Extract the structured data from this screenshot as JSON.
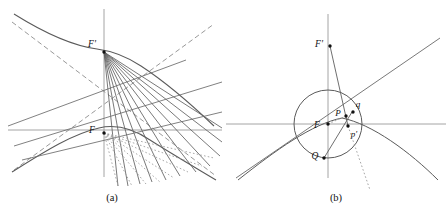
{
  "figure": {
    "panels": [
      {
        "id": "a",
        "caption": "(a)",
        "description": "Hyperbola with two foci and pencils of rays",
        "labels": [
          {
            "name": "focus-F-prime",
            "text": "F'",
            "x": 92,
            "y": 47
          },
          {
            "name": "focus-F",
            "text": "F",
            "x": 92,
            "y": 133
          }
        ]
      },
      {
        "id": "b",
        "caption": "(b)",
        "description": "Circle, parabola and directrix construction with points P, Q, p, q",
        "labels": [
          {
            "name": "focus-F-prime",
            "text": "F'",
            "x": 86,
            "y": 46
          },
          {
            "name": "point-P",
            "text": "P",
            "x": 104,
            "y": 115
          },
          {
            "name": "point-q",
            "text": "q",
            "x": 122,
            "y": 106
          },
          {
            "name": "point-p-prime",
            "text": "p'",
            "x": 118,
            "y": 133
          },
          {
            "name": "focus-F",
            "text": "F",
            "x": 86,
            "y": 129
          },
          {
            "name": "point-Q",
            "text": "Q",
            "x": 92,
            "y": 161
          }
        ]
      }
    ]
  },
  "colors": {
    "curve": "#555555",
    "axis": "#999999",
    "ray": "#666666",
    "dashed": "#888888",
    "dotted": "#999999",
    "point": "#111111",
    "text": "#111111",
    "background": "#ffffff"
  }
}
